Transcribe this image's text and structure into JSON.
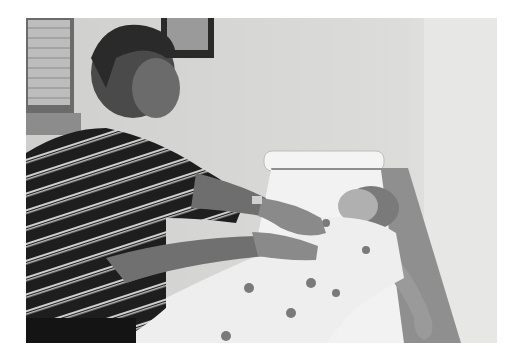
{
  "image": {
    "kind": "photograph",
    "tone": "grayscale",
    "caption": "",
    "alt": "A man in a striped polo shirt places his hands on the abdomen of a young girl lying on an examination table in a patient gown",
    "frame": {
      "x": 26,
      "y": 18,
      "width": 471,
      "height": 325
    },
    "colors": {
      "background": "#ffffff",
      "wall": "#d9d9d7",
      "wall_right": "#e6e6e4",
      "shirt": "#1e1e1e",
      "stripe": "#cfcfcf",
      "skin": "#8a8a8a",
      "gown": "#eeeeee",
      "table_pad": "#8f8f8f",
      "paper": "#f2f2f2"
    }
  }
}
